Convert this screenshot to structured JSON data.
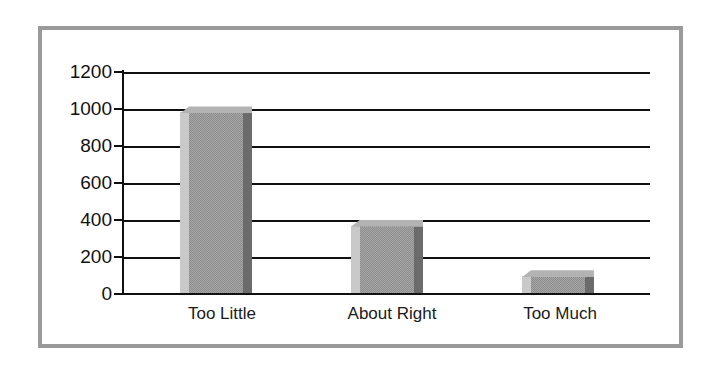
{
  "chart_data": {
    "type": "bar",
    "title": "",
    "subtitle": "",
    "xlabel": "",
    "ylabel": "",
    "categories": [
      "Too Little",
      "About Right",
      "Too Much"
    ],
    "values": [
      975,
      360,
      85
    ],
    "series": [
      {
        "name": "Responses",
        "values": [
          975,
          360,
          85
        ]
      }
    ],
    "ylim": [
      0,
      1200
    ],
    "ytick_labels": [
      "1200",
      "1000",
      "800",
      "600",
      "400",
      "200",
      "0"
    ],
    "ytick_values": [
      1200,
      1000,
      800,
      600,
      400,
      200,
      0
    ],
    "grid": true,
    "grid_axis": "y",
    "legend": false,
    "legend_position": "none",
    "bar_style": "3d",
    "colors": {
      "bar_front": "#8d8d8d",
      "bar_left": "#c9c9c9",
      "bar_right": "#6b6b6b",
      "bar_top": "#b3b3b3",
      "axis": "#101010",
      "gridline": "#101010",
      "frame": "#9a9a9a",
      "background": "#ffffff",
      "text": "#111111"
    }
  }
}
